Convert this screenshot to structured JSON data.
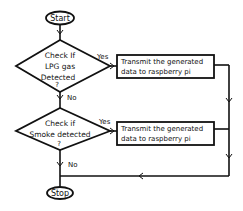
{
  "flowchart": {
    "start": {
      "label": "Start"
    },
    "decisions": [
      {
        "lines": [
          "Check If",
          "LPG gas",
          "Detected",
          "?"
        ],
        "yes_label": "Yes",
        "no_label": "No"
      },
      {
        "lines": [
          "Check if",
          "Smoke detected",
          "?"
        ],
        "yes_label": "Yes",
        "no_label": "No"
      }
    ],
    "processes": [
      {
        "lines": [
          "Transmit the generated",
          "data to raspberry pi"
        ]
      },
      {
        "lines": [
          "Transmit the generated",
          "data to raspberry pi"
        ]
      }
    ],
    "stop": {
      "label": "Stop"
    },
    "colors": {
      "stroke": "#111111",
      "background": "#ffffff",
      "text": "#111111"
    }
  }
}
